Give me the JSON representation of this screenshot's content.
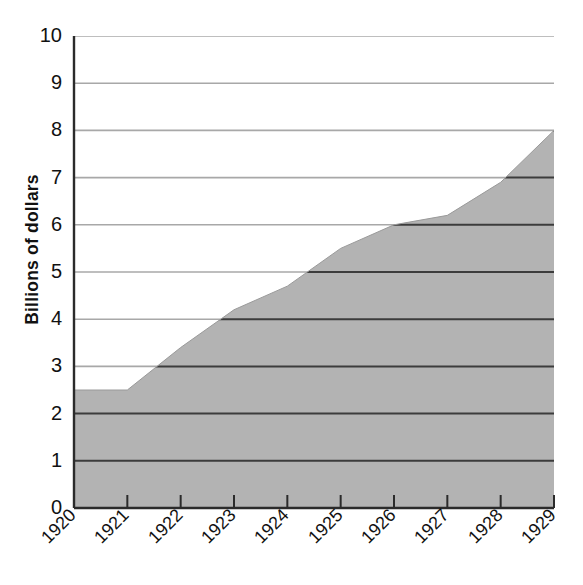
{
  "chart_data": {
    "type": "area",
    "title": "",
    "xlabel": "",
    "ylabel": "Billions of dollars",
    "categories": [
      "1920",
      "1921",
      "1922",
      "1923",
      "1924",
      "1925",
      "1926",
      "1927",
      "1928",
      "1929"
    ],
    "values": [
      2.5,
      2.5,
      3.4,
      4.2,
      4.7,
      5.5,
      6.0,
      6.2,
      6.9,
      8.0
    ],
    "ylim": [
      0,
      10
    ],
    "yticks": [
      "0",
      "1",
      "2",
      "3",
      "4",
      "5",
      "6",
      "7",
      "8",
      "9",
      "10"
    ],
    "ytick_values": [
      0,
      1,
      2,
      3,
      4,
      5,
      6,
      7,
      8,
      9,
      10
    ],
    "grid": true,
    "legend": "none",
    "series": [
      {
        "name": "Billions of dollars",
        "values": [
          2.5,
          2.5,
          3.4,
          4.2,
          4.7,
          5.5,
          6.0,
          6.2,
          6.9,
          8.0
        ]
      }
    ],
    "colors": {
      "area_fill": "#b3b3b3",
      "gridline_over_fill": "#3c3c3c",
      "gridline_above_fill": "#a8a8a8",
      "axis": "#2b2b2b",
      "text": "#111111"
    }
  }
}
